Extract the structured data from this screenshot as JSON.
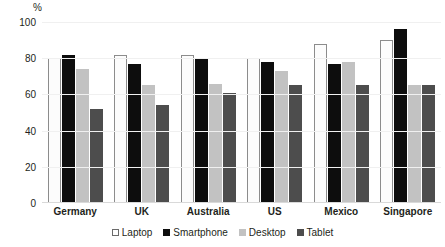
{
  "chart_data": {
    "type": "bar",
    "title": "",
    "subtitle": "",
    "xlabel": "",
    "ylabel": "%",
    "ylim": [
      0,
      100
    ],
    "yticks": [
      0,
      20,
      40,
      60,
      80,
      100
    ],
    "grid": true,
    "legend_position": "bottom",
    "categories": [
      "Germany",
      "UK",
      "Australia",
      "US",
      "Mexico",
      "Singapore"
    ],
    "series": [
      {
        "name": "Laptop",
        "color": "#ffffff",
        "values": [
          80,
          82,
          82,
          80,
          88,
          90
        ]
      },
      {
        "name": "Smartphone",
        "color": "#0d0d0d",
        "values": [
          82,
          77,
          80,
          78,
          77,
          96
        ]
      },
      {
        "name": "Desktop",
        "color": "#c2c2c2",
        "values": [
          74,
          65,
          66,
          73,
          78,
          65
        ]
      },
      {
        "name": "Tablet",
        "color": "#4d4d4d",
        "values": [
          52,
          54,
          61,
          65,
          65,
          65
        ]
      }
    ]
  },
  "axis": {
    "unit_label": "%",
    "tick_labels": [
      "100",
      "80",
      "60",
      "40",
      "20",
      "0"
    ]
  },
  "legend": {
    "items": [
      {
        "label": "Laptop"
      },
      {
        "label": "Smartphone"
      },
      {
        "label": "Desktop"
      },
      {
        "label": "Tablet"
      }
    ]
  }
}
